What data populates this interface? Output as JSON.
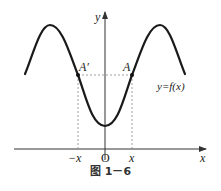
{
  "figure": {
    "caption": "图 1－6",
    "function_label": "y=f(x)",
    "axes": {
      "x_label": "x",
      "y_label": "y",
      "origin_label": "O"
    },
    "points": [
      {
        "name": "A′",
        "x_label": "−x"
      },
      {
        "name": "A",
        "x_label": "x"
      }
    ],
    "colors": {
      "curve": "#1a1a1a",
      "axis": "#333333",
      "guide": "#777777"
    }
  }
}
